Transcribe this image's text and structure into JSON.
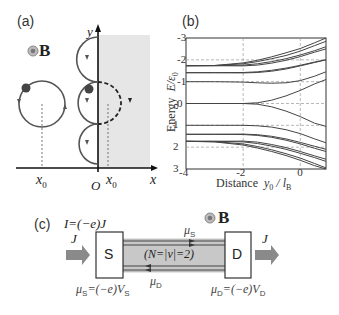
{
  "panels": {
    "a": {
      "label": "(a)",
      "field_label": "B",
      "field_symbol": "out-of-plane-field-icon",
      "axis_x_label": "x",
      "axis_y_label": "y",
      "origin_label": "O",
      "x0_left_label": "x",
      "x0_left_sub": "0",
      "x0_right_label": "x",
      "x0_right_sub": "0",
      "shaded_region": "x > 0",
      "colors": {
        "shade": "#e6e6e6",
        "orbit": "#555555",
        "electron": "#444444",
        "axis": "#111111"
      }
    },
    "b": {
      "label": "(b)",
      "ylabel_main": "Energy",
      "ylabel_var": "E/ε",
      "ylabel_sub": "0",
      "xlabel_main": "Distance",
      "xlabel_var": "y",
      "xlabel_sub1": "0",
      "xlabel_slash": " / l",
      "xlabel_sub2": "B",
      "yticks": [
        "3",
        "2",
        "1",
        "0",
        "-1",
        "-2",
        "-3"
      ],
      "xticks": [
        "-4",
        "-2",
        "0"
      ]
    },
    "c": {
      "label": "(c)",
      "current_eq": "I=(−e)J",
      "field_label": "B",
      "flux_in_label": "J",
      "flux_out_label": "J",
      "source_label": "S",
      "drain_label": "D",
      "channel_label": "(N=|ν|=2)",
      "mu_top_label": "μ",
      "mu_top_sub": "S",
      "mu_bottom_label": "μ",
      "mu_bottom_sub": "D",
      "source_eq_mu": "μ",
      "source_eq_sub": "S",
      "source_eq_rest": "=(−e)V",
      "source_eq_vsub": "S",
      "drain_eq_mu": "μ",
      "drain_eq_sub": "D",
      "drain_eq_rest": "=(−e)V",
      "drain_eq_vsub": "D",
      "colors": {
        "channel": "#c8c8c8",
        "arrow": "#8a8a8a",
        "edge_line": "#444444"
      }
    }
  },
  "chart_data": {
    "type": "line",
    "title": "",
    "xlabel": "Distance y0 / lB",
    "ylabel": "Energy E/ε0",
    "xlim": [
      -4,
      0.9
    ],
    "ylim": [
      -3,
      3
    ],
    "xticks": [
      -4,
      -2,
      0
    ],
    "yticks": [
      -3,
      -2,
      -1,
      0,
      1,
      2,
      3
    ],
    "grid": "dashed at x=-2, x=0, y=-2,-1,0,1,2",
    "x": [
      -4,
      -3,
      -2,
      -1.5,
      -1,
      -0.5,
      0,
      0.5,
      0.9
    ],
    "series": [
      {
        "name": "n=0 upper",
        "values": [
          0,
          0,
          0,
          0.03,
          0.15,
          0.35,
          0.6,
          0.9,
          1.1
        ]
      },
      {
        "name": "n=0 lower",
        "values": [
          0,
          0,
          0,
          -0.03,
          -0.15,
          -0.35,
          -0.6,
          -0.9,
          -1.05
        ]
      },
      {
        "name": "+1",
        "values": [
          1.0,
          1.0,
          0.98,
          0.95,
          0.93,
          0.95,
          1.05,
          1.25,
          1.45
        ]
      },
      {
        "name": "+1.41 a",
        "values": [
          1.41,
          1.41,
          1.42,
          1.45,
          1.52,
          1.62,
          1.75,
          1.9,
          2.0
        ]
      },
      {
        "name": "+1.41 b",
        "values": [
          1.41,
          1.41,
          1.4,
          1.42,
          1.48,
          1.58,
          1.72,
          1.88,
          2.0
        ]
      },
      {
        "name": "+1.73 a",
        "values": [
          1.73,
          1.73,
          1.76,
          1.82,
          1.92,
          2.05,
          2.22,
          2.42,
          2.6
        ]
      },
      {
        "name": "+1.73 b",
        "values": [
          1.73,
          1.73,
          1.72,
          1.76,
          1.85,
          1.98,
          2.15,
          2.35,
          2.5
        ]
      },
      {
        "name": "+2 a",
        "values": [
          1.73,
          1.74,
          1.82,
          1.92,
          2.05,
          2.2,
          2.4,
          2.65,
          2.85
        ]
      },
      {
        "name": "+2 b",
        "values": [
          1.73,
          1.74,
          1.86,
          1.98,
          2.14,
          2.32,
          2.52,
          2.78,
          3.0
        ]
      },
      {
        "name": "-1",
        "values": [
          -1.0,
          -1.0,
          -1.0,
          -1.02,
          -1.08,
          -1.2,
          -1.38,
          -1.62,
          -1.8
        ]
      },
      {
        "name": "-1.41 a",
        "values": [
          -1.41,
          -1.41,
          -1.42,
          -1.46,
          -1.55,
          -1.68,
          -1.85,
          -2.05,
          -2.2
        ]
      },
      {
        "name": "-1.41 b",
        "values": [
          -1.41,
          -1.41,
          -1.4,
          -1.43,
          -1.5,
          -1.62,
          -1.78,
          -1.96,
          -2.1
        ]
      },
      {
        "name": "-1.73 a",
        "values": [
          -1.73,
          -1.73,
          -1.76,
          -1.83,
          -1.95,
          -2.1,
          -2.28,
          -2.48,
          -2.65
        ]
      },
      {
        "name": "-1.73 b",
        "values": [
          -1.73,
          -1.73,
          -1.72,
          -1.77,
          -1.88,
          -2.02,
          -2.2,
          -2.4,
          -2.55
        ]
      },
      {
        "name": "-2 a",
        "values": [
          -1.73,
          -1.75,
          -1.85,
          -1.97,
          -2.12,
          -2.3,
          -2.5,
          -2.75,
          -2.95
        ]
      },
      {
        "name": "-2 b",
        "values": [
          -1.73,
          -1.76,
          -1.9,
          -2.04,
          -2.2,
          -2.38,
          -2.6,
          -2.85,
          -3.0
        ]
      }
    ]
  }
}
